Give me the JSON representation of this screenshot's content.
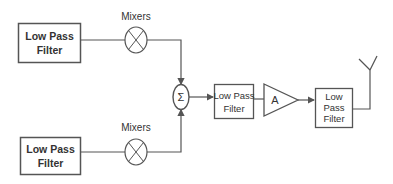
{
  "diagram": {
    "type": "block-diagram",
    "blocks": {
      "lpf_top": {
        "line1": "Low Pass",
        "line2": "Filter"
      },
      "lpf_bottom": {
        "line1": "Low Pass",
        "line2": "Filter"
      },
      "lpf_middle": {
        "line1": "Low Pass",
        "line2": "Filter"
      },
      "lpf_output": {
        "line1": "Low",
        "line2": "Pass",
        "line3": "Filter"
      }
    },
    "mixers": {
      "top_label": "Mixers",
      "bottom_label": "Mixers"
    },
    "summer": {
      "symbol": "Σ"
    },
    "amplifier": {
      "label": "A"
    },
    "antenna": {
      "name": "antenna"
    },
    "colors": {
      "stroke": "#555555",
      "text": "#333333",
      "background": "#ffffff"
    }
  }
}
